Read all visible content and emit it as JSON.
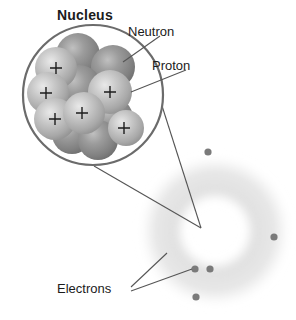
{
  "figure": {
    "background_color": "#ffffff"
  },
  "labels": {
    "nucleus": "Nucleus",
    "neutron": "Neutron",
    "proton": "Proton",
    "electrons": "Electrons"
  },
  "colors": {
    "outline": "#6b6b6b",
    "leader_line": "#555555",
    "proton_sphere": "#b9b9b9",
    "neutron_sphere": "#8e8e8e",
    "electron_dot": "#7a7a7a",
    "electron_cloud": "#cfcfcf",
    "text": "#1b1b1b"
  },
  "nucleus": {
    "circle": {
      "cx": 93,
      "cy": 95,
      "r": 70
    },
    "particles": [
      {
        "type": "neutron",
        "cx": 78,
        "cy": 55,
        "r": 22,
        "charge": ""
      },
      {
        "type": "proton",
        "cx": 56,
        "cy": 68,
        "r": 21,
        "charge": "+"
      },
      {
        "type": "neutron",
        "cx": 113,
        "cy": 67,
        "r": 22,
        "charge": ""
      },
      {
        "type": "proton",
        "cx": 48,
        "cy": 93,
        "r": 21,
        "charge": "+"
      },
      {
        "type": "neutron",
        "cx": 79,
        "cy": 88,
        "r": 23,
        "charge": ""
      },
      {
        "type": "proton",
        "cx": 110,
        "cy": 92,
        "r": 22,
        "charge": "+"
      },
      {
        "type": "proton",
        "cx": 55,
        "cy": 119,
        "r": 21,
        "charge": "+"
      },
      {
        "type": "proton",
        "cx": 84,
        "cy": 113,
        "r": 21,
        "charge": "+"
      },
      {
        "type": "neutron",
        "cx": 112,
        "cy": 118,
        "r": 21,
        "charge": ""
      },
      {
        "type": "proton",
        "cx": 120,
        "cy": 127,
        "r": 18,
        "charge": "+"
      },
      {
        "type": "neutron",
        "cx": 72,
        "cy": 134,
        "r": 20,
        "charge": ""
      },
      {
        "type": "neutron",
        "cx": 98,
        "cy": 140,
        "r": 20,
        "charge": ""
      }
    ]
  },
  "atom": {
    "cloud": {
      "cx": 215,
      "cy": 231,
      "outer_r": 76,
      "inner_r": 38
    },
    "electrons": [
      {
        "cx": 208,
        "cy": 152,
        "r": 3.6
      },
      {
        "cx": 274,
        "cy": 237,
        "r": 3.6
      },
      {
        "cx": 195,
        "cy": 269,
        "r": 3.6
      },
      {
        "cx": 210,
        "cy": 269,
        "r": 3.6
      },
      {
        "cx": 196,
        "cy": 297,
        "r": 3.6
      }
    ]
  },
  "leader_lines": [
    {
      "name": "neutron-leader",
      "x1": 160,
      "y1": 36,
      "x2": 123,
      "y2": 62
    },
    {
      "name": "proton-leader",
      "x1": 186,
      "y1": 70,
      "x2": 131,
      "y2": 92
    },
    {
      "name": "magnifier-upper",
      "x1": 148,
      "y1": 62,
      "x2": 201,
      "y2": 228
    },
    {
      "name": "magnifier-lower",
      "x1": 94,
      "y1": 166,
      "x2": 201,
      "y2": 228
    },
    {
      "name": "electrons-leader-upper",
      "x1": 131,
      "y1": 287,
      "x2": 167,
      "y2": 253
    },
    {
      "name": "electrons-leader-lower",
      "x1": 131,
      "y1": 291,
      "x2": 192,
      "y2": 269
    }
  ]
}
